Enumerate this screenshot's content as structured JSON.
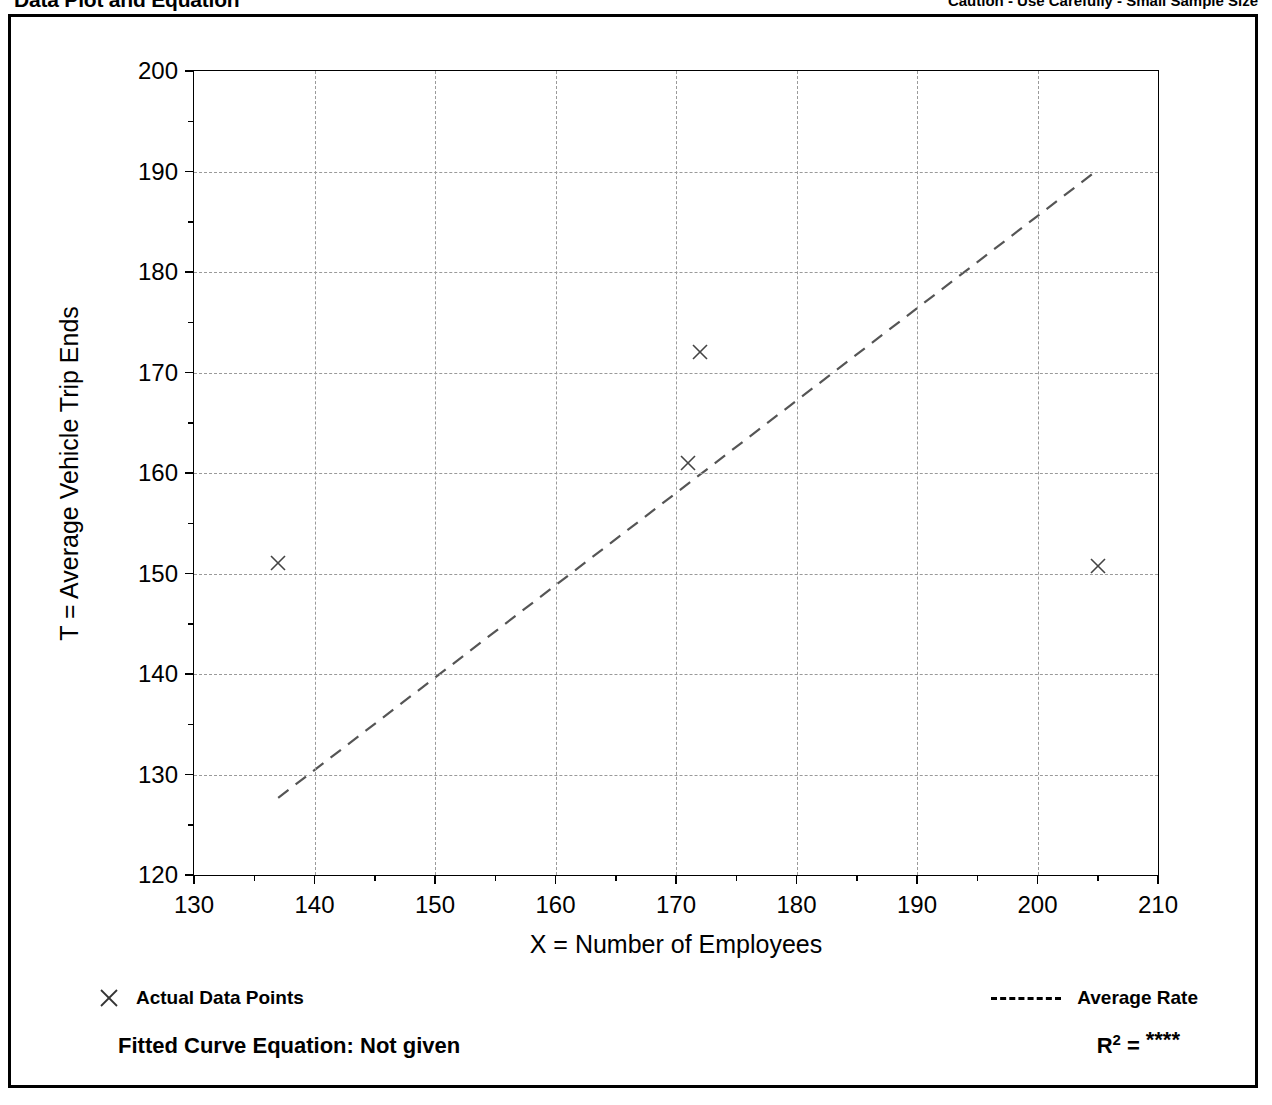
{
  "header": {
    "title": "Data Plot and Equation",
    "caution": "Caution - Use Carefully - Small Sample Size"
  },
  "legend": {
    "data_points_label": "Actual Data Points",
    "average_rate_label": "Average Rate",
    "data_points_marker": "x-marker-icon",
    "average_rate_marker": "dashed-line-icon"
  },
  "equation": {
    "fitted_curve_label": "Fitted Curve Equation:  Not given",
    "r_symbol": "R",
    "r_exponent": "2",
    "equals": "=",
    "r_squared_value": "****"
  },
  "chart_data": {
    "type": "scatter",
    "title": "Data Plot and Equation",
    "xlabel": "X = Number of Employees",
    "ylabel": "T = Average Vehicle Trip Ends",
    "xlim": [
      130,
      210
    ],
    "ylim": [
      120,
      200
    ],
    "xticks": [
      130,
      140,
      150,
      160,
      170,
      180,
      190,
      200,
      210
    ],
    "yticks": [
      120,
      130,
      140,
      150,
      160,
      170,
      180,
      190,
      200
    ],
    "xminorticks": [
      135,
      145,
      155,
      165,
      175,
      185,
      195,
      205
    ],
    "yminorticks": [
      125,
      135,
      145,
      155,
      165,
      175,
      185,
      195
    ],
    "xtick_labels": [
      "130",
      "140",
      "150",
      "160",
      "170",
      "180",
      "190",
      "200",
      "210"
    ],
    "ytick_labels": [
      "120",
      "130",
      "140",
      "150",
      "160",
      "170",
      "180",
      "190",
      "200"
    ],
    "grid": true,
    "legend_position": "below-plot",
    "series": [
      {
        "name": "Actual Data Points",
        "type": "scatter",
        "marker": "x",
        "points": [
          {
            "x": 137,
            "y": 151
          },
          {
            "x": 172,
            "y": 172
          },
          {
            "x": 171,
            "y": 161
          },
          {
            "x": 205,
            "y": 150.7
          }
        ]
      },
      {
        "name": "Average Rate",
        "type": "line",
        "style": "dashed",
        "points": [
          {
            "x": 137,
            "y": 127.5
          },
          {
            "x": 205,
            "y": 190
          }
        ]
      }
    ]
  }
}
